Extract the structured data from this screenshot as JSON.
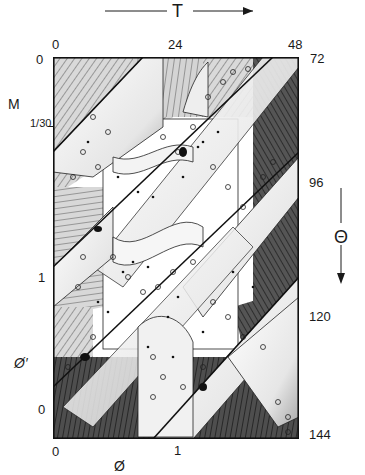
{
  "figure": {
    "type": "phase-space diagram",
    "top_axis": {
      "symbol": "T",
      "ticks": [
        "0",
        "24",
        "48"
      ]
    },
    "right_axis": {
      "symbol": "Θ",
      "ticks": [
        "72",
        "96",
        "120",
        "144"
      ]
    },
    "left_axis": {
      "upper_symbol": "M",
      "upper_ticks": [
        "0",
        "1/30"
      ],
      "lower_symbol": "Ø′",
      "lower_ticks": [
        "1",
        "0"
      ]
    },
    "bottom_axis": {
      "symbol": "Ø",
      "ticks": [
        "0",
        "1"
      ]
    },
    "colors": {
      "ink": "#1a1a1a",
      "light_hatch": "#bdbdbd",
      "dark_hatch": "#4a4a4a",
      "surface": "#f2f2f2",
      "paper": "#ffffff"
    }
  }
}
